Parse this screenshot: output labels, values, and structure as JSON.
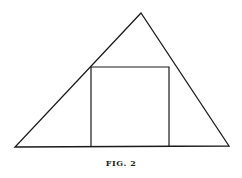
{
  "figure": {
    "caption": "FIG. 2",
    "stroke_color": "#1a1a1a",
    "triangle": {
      "apex": [
        141,
        13
      ],
      "base_left": [
        15,
        147
      ],
      "base_right": [
        229,
        146
      ]
    },
    "square": {
      "left": 91,
      "right": 169,
      "top": 67,
      "bottom": 147
    }
  }
}
